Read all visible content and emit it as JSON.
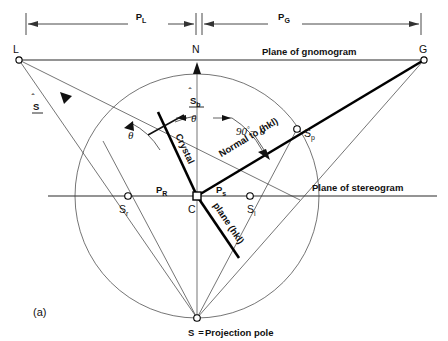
{
  "figure": {
    "caption": "(a)",
    "dimensions": [
      {
        "id": "PL",
        "label": "P",
        "subscript": "L"
      },
      {
        "id": "PG",
        "label": "P",
        "subscript": "G"
      }
    ],
    "plane_labels": {
      "gnomogram": "Plane of gnomogram",
      "stereogram": "Plane of stereogram"
    },
    "points": [
      {
        "id": "L",
        "label": "L"
      },
      {
        "id": "N",
        "label": "N"
      },
      {
        "id": "G",
        "label": "G"
      },
      {
        "id": "C",
        "label": "C"
      },
      {
        "id": "Sp",
        "label": "S",
        "subscript": "p"
      },
      {
        "id": "Sr",
        "label": "S",
        "subscript": "r"
      },
      {
        "id": "Sl",
        "label": "S",
        "subscript": "l"
      },
      {
        "id": "S",
        "label": "S"
      }
    ],
    "segment_labels": [
      {
        "id": "PR",
        "label": "P",
        "subscript": "R"
      },
      {
        "id": "Ps",
        "label": "P",
        "subscript": "s"
      }
    ],
    "vectors": [
      {
        "id": "S-hat",
        "label": "S",
        "subscript": "",
        "hat": true,
        "underlined": true
      },
      {
        "id": "S-hat-b",
        "label": "S",
        "subscript": "b",
        "hat": true,
        "underlined": true
      }
    ],
    "ray_labels": {
      "normal": "Normal to (hkl)",
      "crystal": "Crystal",
      "plane_hkl": "plane (hkl)"
    },
    "angles": [
      {
        "id": "theta-left",
        "label": "θ"
      },
      {
        "id": "theta-top",
        "label": "θ"
      },
      {
        "id": "ninety-minus-theta",
        "label": "90",
        "superscript": "°",
        "remainder": "− θ"
      }
    ],
    "projection_pole_note": {
      "symbol": "S",
      "equals": "=",
      "text": "Projection pole"
    },
    "colors": {
      "ink": "#111111",
      "thin_line": "#3a3a3a",
      "background": "#ffffff"
    }
  }
}
